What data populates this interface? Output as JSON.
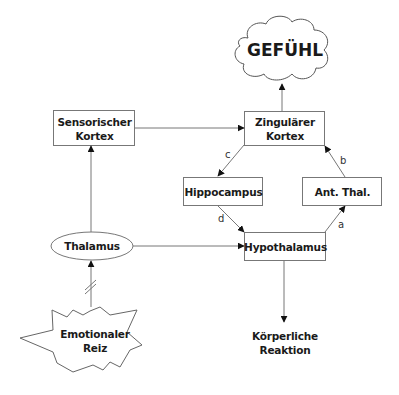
{
  "diagram": {
    "type": "flowchart",
    "nodes": {
      "gefuehl": {
        "label": "GEFÜHL",
        "shape": "cloud"
      },
      "sensorischer_kortex": {
        "label_line1": "Sensorischer",
        "label_line2": "Kortex",
        "shape": "rectangle"
      },
      "zingulaerer_kortex": {
        "label_line1": "Zingulärer",
        "label_line2": "Kortex",
        "shape": "rectangle"
      },
      "hippocampus": {
        "label": "Hippocampus",
        "shape": "rectangle"
      },
      "ant_thal": {
        "label": "Ant. Thal.",
        "shape": "rectangle"
      },
      "thalamus": {
        "label": "Thalamus",
        "shape": "ellipse"
      },
      "hypothalamus": {
        "label": "Hypothalamus",
        "shape": "rectangle"
      },
      "emotionaler_reiz": {
        "label_line1": "Emotionaler",
        "label_line2": "Reiz",
        "shape": "starburst"
      },
      "koerperliche_reaktion": {
        "label_line1": "Körperliche",
        "label_line2": "Reaktion",
        "shape": "text"
      }
    },
    "edges": [
      {
        "from": "Emotionaler Reiz",
        "to": "Thalamus",
        "label": "",
        "style": "broken (//)"
      },
      {
        "from": "Thalamus",
        "to": "Sensorischer Kortex",
        "label": ""
      },
      {
        "from": "Thalamus",
        "to": "Hypothalamus",
        "label": ""
      },
      {
        "from": "Sensorischer Kortex",
        "to": "Zingulärer Kortex",
        "label": ""
      },
      {
        "from": "Zingulärer Kortex",
        "to": "GEFÜHL",
        "label": ""
      },
      {
        "from": "Zingulärer Kortex",
        "to": "Hippocampus",
        "label": "c"
      },
      {
        "from": "Hippocampus",
        "to": "Hypothalamus",
        "label": "d"
      },
      {
        "from": "Hypothalamus",
        "to": "Ant. Thal.",
        "label": "a"
      },
      {
        "from": "Ant. Thal.",
        "to": "Zingulärer Kortex",
        "label": "b"
      },
      {
        "from": "Hypothalamus",
        "to": "Körperliche Reaktion",
        "label": ""
      }
    ],
    "edge_labels": {
      "a": "a",
      "b": "b",
      "c": "c",
      "d": "d"
    },
    "colors": {
      "stroke": "#555555",
      "text": "#1a1a1a",
      "background": "#ffffff"
    }
  }
}
